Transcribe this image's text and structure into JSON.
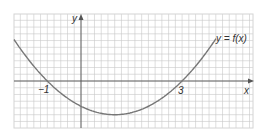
{
  "chart_data": {
    "type": "line",
    "title": "",
    "xlabel": "x",
    "ylabel": "y",
    "curve_label": "y = f(x)",
    "function": "f(x) = (x + 1)(x - 3) / 4",
    "x_intercepts": [
      -1,
      3
    ],
    "tick_labels": [
      "-1",
      "3"
    ],
    "vertex": {
      "x": 1,
      "y": -1
    },
    "x": [
      -2,
      -1.5,
      -1,
      -0.5,
      0,
      0.5,
      1,
      1.5,
      2,
      2.5,
      3,
      3.5,
      4,
      4.5,
      5
    ],
    "values": [
      1.25,
      0.56,
      0,
      -0.44,
      -0.75,
      -0.94,
      -1,
      -0.94,
      -0.75,
      -0.44,
      0,
      0.56,
      1.25,
      2.06,
      3.0
    ],
    "xlim": [
      -2,
      5
    ],
    "ylim": [
      -1.4,
      2
    ],
    "grid": true,
    "grid_minor_divisions_per_unit": 5,
    "colors": {
      "grid": "#c8c8c8",
      "axes": "#555555",
      "curve": "#777777",
      "border": "#cfcfcf"
    }
  },
  "labels": {
    "y_axis": "y",
    "x_axis": "x",
    "curve": "y = f(x)",
    "tick_neg1": "−1",
    "tick_3": "3"
  }
}
